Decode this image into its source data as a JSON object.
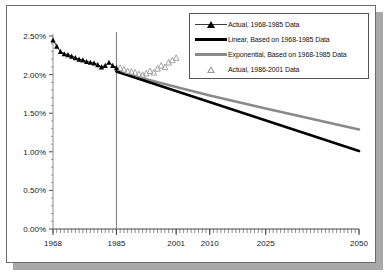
{
  "chart_data": {
    "type": "line",
    "title": "",
    "subtitle": "",
    "xlabel": "",
    "ylabel": "",
    "xlim": [
      1968,
      2050
    ],
    "ylim": [
      0.0,
      2.5
    ],
    "grid": false,
    "legend_position": "top-right",
    "ytick_labels": [
      "0.00%",
      "0.50%",
      "1.00%",
      "1.50%",
      "2.00%",
      "2.50%"
    ],
    "ytick_values": [
      0.0,
      0.5,
      1.0,
      1.5,
      2.0,
      2.5
    ],
    "xtick_labels": [
      "1968",
      "1985",
      "2001",
      "2010",
      "2025",
      "2050"
    ],
    "xtick_values": [
      1968,
      1985,
      2001,
      2010,
      2025,
      2050
    ],
    "minor_xticks_every": 1,
    "annotations": [
      {
        "name": "divider-1985",
        "type": "vline",
        "x": 1985
      }
    ],
    "series": [
      {
        "name": "Actual, 1968-1985 Data",
        "key": "actual_1968_1985",
        "type": "line+marker",
        "marker": "filled-triangle",
        "color": "#000000",
        "x": [
          1968,
          1969,
          1970,
          1971,
          1972,
          1973,
          1974,
          1975,
          1976,
          1977,
          1978,
          1979,
          1980,
          1981,
          1982,
          1983,
          1984,
          1985
        ],
        "y": [
          2.45,
          2.37,
          2.3,
          2.27,
          2.26,
          2.24,
          2.22,
          2.2,
          2.19,
          2.17,
          2.16,
          2.15,
          2.13,
          2.1,
          2.12,
          2.16,
          2.12,
          2.09
        ]
      },
      {
        "name": "Linear, Based on 1968-1985 Data",
        "key": "linear_projection",
        "type": "line",
        "marker": "none",
        "color": "#000000",
        "width": 2.6,
        "x": [
          1985,
          2050
        ],
        "y": [
          2.04,
          1.01
        ]
      },
      {
        "name": "Exponential, Based on 1968-1985 Data",
        "key": "exponential_projection",
        "type": "line",
        "marker": "none",
        "color": "#8a8a8a",
        "width": 2.6,
        "x": [
          1985,
          2001,
          2010,
          2025,
          2050
        ],
        "y": [
          2.04,
          1.84,
          1.73,
          1.56,
          1.29
        ]
      },
      {
        "name": "Actual, 1986-2001 Data",
        "key": "actual_1986_2001",
        "type": "marker",
        "marker": "open-triangle",
        "color": "#9a9a9a",
        "x": [
          1986,
          1987,
          1988,
          1989,
          1990,
          1991,
          1992,
          1993,
          1994,
          1995,
          1996,
          1997,
          1998,
          1999,
          2000,
          2001
        ],
        "y": [
          2.09,
          2.07,
          2.05,
          2.04,
          2.03,
          2.01,
          2.0,
          2.02,
          2.05,
          2.03,
          2.08,
          2.12,
          2.1,
          2.16,
          2.19,
          2.22
        ]
      }
    ]
  },
  "legend": {
    "items": [
      {
        "label": "Actual, 1968-1985 Data",
        "key_style": "line-with-filled-triangle"
      },
      {
        "label": "Linear, Based on 1968-1985 Data",
        "key_style": "thick-black-bar"
      },
      {
        "label": "Exponential, Based on 1968-1985 Data",
        "key_style": "thick-gray-bar"
      },
      {
        "label": "Actual, 1986-2001 Data",
        "key_style": "open-triangle"
      }
    ]
  }
}
